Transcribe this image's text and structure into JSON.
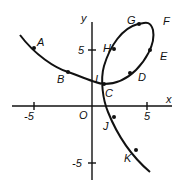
{
  "diagram": {
    "axes": {
      "x_label": "x",
      "y_label": "y",
      "origin_label": "O",
      "x_ticks": [
        "-5",
        "5"
      ],
      "y_ticks": [
        "5",
        "-5"
      ]
    },
    "points": [
      {
        "label": "A",
        "x": -4.4,
        "y": 4.2
      },
      {
        "label": "B",
        "x": -1.5,
        "y": 1.9
      },
      {
        "label": "C",
        "x": 1.2,
        "y": 0.9
      },
      {
        "label": "I",
        "x": 1.2,
        "y": 0.9
      },
      {
        "label": "D",
        "x": 3.2,
        "y": 1.8
      },
      {
        "label": "E",
        "x": 5.1,
        "y": 4.2
      },
      {
        "label": "F",
        "x": 5.3,
        "y": 6.6
      },
      {
        "label": "G",
        "x": 3.3,
        "y": 6.3
      },
      {
        "label": "H",
        "x": 2.2,
        "y": 4.0
      },
      {
        "label": "J",
        "x": 1.9,
        "y": -1.3
      },
      {
        "label": "K",
        "x": 3.6,
        "y": -4.4
      }
    ]
  }
}
